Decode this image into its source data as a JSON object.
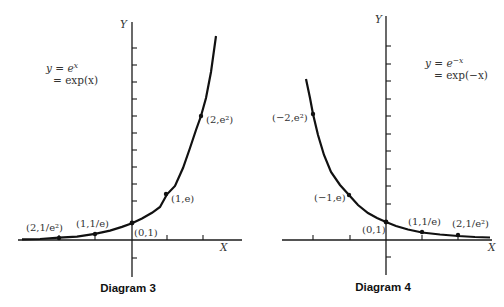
{
  "diagram3": {
    "caption": "Diagram 3",
    "y_axis_label": "Y",
    "x_axis_label": "X",
    "equation_line1": "y = e",
    "equation_line1_sup": "x",
    "equation_line2": "= exp(x)",
    "points": [
      {
        "label": "(2,1/e²)"
      },
      {
        "label": "(1,1/e)"
      },
      {
        "label": "(0,1)"
      },
      {
        "label": "(1,e)"
      },
      {
        "label": "(2,e²)"
      }
    ]
  },
  "diagram4": {
    "caption": "Diagram 4",
    "y_axis_label": "Y",
    "x_axis_label": "X",
    "equation_line1": "y = e",
    "equation_line1_sup": "−x",
    "equation_line2": "= exp(−x)",
    "points": [
      {
        "label": "(−2,e²)"
      },
      {
        "label": "(−1,e)"
      },
      {
        "label": "(0,1)"
      },
      {
        "label": "(1,1/e)"
      },
      {
        "label": "(2,1/e²)"
      }
    ]
  }
}
